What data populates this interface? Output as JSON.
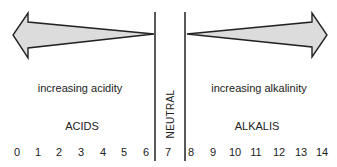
{
  "diagram": {
    "left_arrow_label": "increasing acidity",
    "right_arrow_label": "increasing alkalinity",
    "left_region_label": "ACIDS",
    "right_region_label": "ALKALIS",
    "center_label": "NEUTRAL",
    "scale": [
      "0",
      "1",
      "2",
      "3",
      "4",
      "5",
      "6",
      "7",
      "8",
      "9",
      "10",
      "11",
      "12",
      "13",
      "14"
    ],
    "colors": {
      "arrow_fill": "#dcdcdc",
      "stroke": "#222222"
    }
  }
}
